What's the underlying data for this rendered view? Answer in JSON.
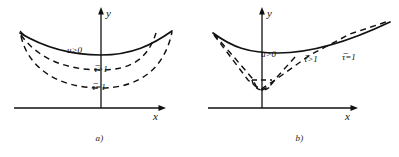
{
  "figure": {
    "panels": [
      {
        "id": "a",
        "caption": "a)",
        "axis": {
          "x_label": "x",
          "y_label": "y"
        },
        "labels": {
          "region": "u>0",
          "curve_mid": "τ̅>1",
          "curve_outer": "τ̅=1"
        },
        "curves": [
          {
            "name": "solid-boundary",
            "style": "solid",
            "shape": "shallow-u"
          },
          {
            "name": "dashed-inner",
            "style": "dashed",
            "shape": "u"
          },
          {
            "name": "dashed-outer",
            "style": "dashed",
            "shape": "deep-u"
          }
        ]
      },
      {
        "id": "b",
        "caption": "b)",
        "axis": {
          "x_label": "x",
          "y_label": "y"
        },
        "labels": {
          "region": "u>0",
          "curve_mid": "τ̅>1",
          "curve_outer": "τ̅=1"
        },
        "curves": [
          {
            "name": "solid-boundary",
            "style": "solid",
            "shape": "shallow-u"
          },
          {
            "name": "dashed-inner",
            "style": "dashed",
            "shape": "narrow-v"
          },
          {
            "name": "dashed-outer",
            "style": "dashed",
            "shape": "wide-v"
          }
        ]
      }
    ],
    "colors": {
      "ink": "#111111",
      "background": "#ffffff"
    }
  }
}
